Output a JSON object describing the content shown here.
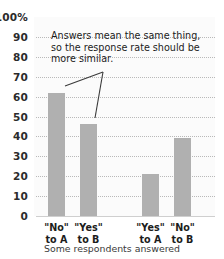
{
  "chart_data": {
    "type": "bar",
    "title": "",
    "subtitle": "",
    "xlabel": "Some respondents answered",
    "ylabel": "",
    "ylim": [
      0,
      100
    ],
    "grid": true,
    "legend": false,
    "categories": [
      "\"No\"\nto A",
      "\"Yes\"\nto B",
      "\"Yes\"\nto A",
      "\"No\"\nto B"
    ],
    "values": [
      62,
      46,
      21,
      39
    ],
    "bar_color": "#b0b0b0",
    "annotations": [
      {
        "text": "Answers mean the same thing, so the response rate should be more similar.",
        "points_to": [
          "\"No\" to A",
          "\"Yes\" to B"
        ]
      }
    ]
  },
  "axis": {
    "y_ticks": [
      "100%",
      "90",
      "80",
      "70",
      "60",
      "50",
      "40",
      "30",
      "20",
      "10",
      "0"
    ],
    "y_values": [
      100,
      90,
      80,
      70,
      60,
      50,
      40,
      30,
      20,
      10,
      0
    ]
  },
  "x_labels": [
    {
      "line1": "\"No\"",
      "line2": "to A"
    },
    {
      "line1": "\"Yes\"",
      "line2": "to B"
    },
    {
      "line1": "\"Yes\"",
      "line2": "to A"
    },
    {
      "line1": "\"No\"",
      "line2": "to B"
    }
  ],
  "caption": "Some respondents answered",
  "annotation": {
    "text": "Answers mean the same thing, so the response rate should be more similar."
  },
  "colors": {
    "bar": "#b0b0b0",
    "grid": "#b9b9b9",
    "text": "#1c1c1c",
    "plot_bg": "#fbfbfb",
    "leader": "#3a3a3a"
  }
}
